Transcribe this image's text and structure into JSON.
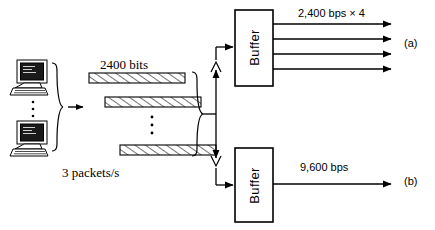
{
  "diagram": {
    "background_color": "#ffffff",
    "line_color": "#000000",
    "sources": {
      "name": "terminal-cluster",
      "terminal_count_shown": 2,
      "ellipsis": "vertical-dots",
      "icon": "computer-terminal-icon"
    },
    "packets": {
      "size_label": "2400 bits",
      "rate_label": "3 packets/s",
      "bars_shown": 3,
      "fill": "diagonal-hatch",
      "ellipsis": "vertical-dots"
    },
    "split": {
      "icon": "brace-split",
      "up_arrow": "arrow-up-icon",
      "down_arrow": "arrow-down-icon"
    },
    "branch_a": {
      "buffer_label": "Buffer",
      "output_rate": "2,400 bps × 4",
      "output_line_count": 4,
      "reference": "(a)"
    },
    "branch_b": {
      "buffer_label": "Buffer",
      "output_rate": "9,600 bps",
      "output_line_count": 1,
      "reference": "(b)"
    }
  }
}
